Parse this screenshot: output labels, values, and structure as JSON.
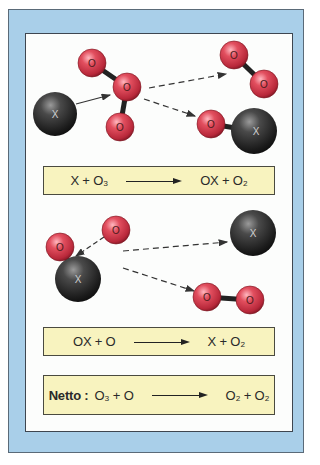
{
  "diagram": {
    "colors": {
      "frame_blue": "#a9cfe9",
      "panel_white": "#fcfdfc",
      "equation_box": "#f8f3bf",
      "oxygen_atom": "#d8404f",
      "catalyst_atom": "#2a2a2a"
    },
    "atom_labels": {
      "oxygen": "O",
      "catalyst": "X"
    },
    "step1": {
      "atoms": [
        {
          "id": "X",
          "role": "catalyst",
          "cx": 55,
          "cy": 114,
          "r": 22
        },
        {
          "id": "O_a",
          "role": "oxygen",
          "cx": 92,
          "cy": 63,
          "r": 14
        },
        {
          "id": "O_b",
          "role": "oxygen",
          "cx": 127,
          "cy": 87,
          "r": 14
        },
        {
          "id": "O_c",
          "role": "oxygen",
          "cx": 120,
          "cy": 127,
          "r": 14
        },
        {
          "id": "O2_a",
          "role": "oxygen",
          "cx": 234,
          "cy": 55,
          "r": 14
        },
        {
          "id": "O2_b",
          "role": "oxygen",
          "cx": 264,
          "cy": 84,
          "r": 14
        },
        {
          "id": "OX_o",
          "role": "oxygen",
          "cx": 211,
          "cy": 124,
          "r": 14
        },
        {
          "id": "OX_x",
          "role": "catalyst",
          "cx": 254,
          "cy": 131,
          "r": 23
        }
      ],
      "equation": {
        "lhs": "X + O₃",
        "arrow": "→",
        "rhs": "OX + O₂"
      }
    },
    "step2": {
      "atoms": [
        {
          "id": "O_bound",
          "role": "oxygen",
          "cx": 60,
          "cy": 247,
          "r": 14
        },
        {
          "id": "O_free",
          "role": "oxygen",
          "cx": 116,
          "cy": 230,
          "r": 14
        },
        {
          "id": "X",
          "role": "catalyst",
          "cx": 78,
          "cy": 279,
          "r": 23
        },
        {
          "id": "X_out",
          "role": "catalyst",
          "cx": 253,
          "cy": 233,
          "r": 23
        },
        {
          "id": "O2_a",
          "role": "oxygen",
          "cx": 207,
          "cy": 297,
          "r": 14
        },
        {
          "id": "O2_b",
          "role": "oxygen",
          "cx": 250,
          "cy": 300,
          "r": 14
        }
      ],
      "equation": {
        "lhs": "OX + O",
        "arrow": "→",
        "rhs": "X + O₂"
      }
    },
    "net": {
      "label": "Netto :",
      "lhs": "O₃ + O",
      "arrow": "→",
      "rhs": "O₂ + O₂"
    }
  }
}
